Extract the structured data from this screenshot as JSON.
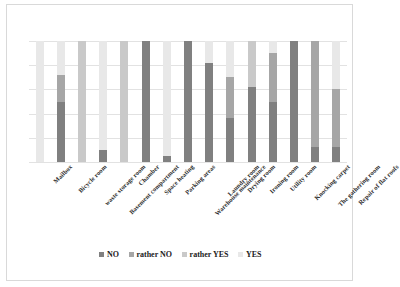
{
  "chart_data": {
    "type": "bar",
    "subtype": "stacked-100-percent",
    "title": "",
    "xlabel": "",
    "ylabel": "",
    "ylim": [
      0,
      100
    ],
    "grid": true,
    "legend_position": "bottom",
    "categories": [
      "Mailbox",
      "Bicycle room",
      "waste storage room",
      "Basement compartment",
      "Chamber",
      "Space heating",
      "Parking areas",
      "Warehouse maintenance",
      "Laundry room",
      "Drying room",
      "Ironing room",
      "Utility room",
      "Knocking carpet",
      "The gathering room",
      "Repair of flat roofs"
    ],
    "series": [
      {
        "name": "NO",
        "color": "#808080",
        "values": [
          0,
          50,
          0,
          10,
          0,
          100,
          5,
          100,
          82,
          36,
          62,
          50,
          100,
          12,
          12
        ]
      },
      {
        "name": "rather NO",
        "color": "#a6a6a6",
        "values": [
          0,
          22,
          0,
          0,
          0,
          0,
          0,
          0,
          0,
          34,
          0,
          40,
          0,
          88,
          48
        ]
      },
      {
        "name": "rather YES",
        "color": "#c9c9c9",
        "values": [
          0,
          0,
          100,
          0,
          100,
          0,
          0,
          0,
          0,
          0,
          38,
          0,
          0,
          0,
          0
        ]
      },
      {
        "name": "YES",
        "color": "#e8e8e8",
        "values": [
          100,
          28,
          0,
          90,
          0,
          0,
          95,
          0,
          18,
          30,
          0,
          10,
          0,
          0,
          40
        ]
      }
    ],
    "gridline_count": 5
  },
  "legend": {
    "items": [
      {
        "label": "NO",
        "color": "#808080"
      },
      {
        "label": "rather NO",
        "color": "#a6a6a6"
      },
      {
        "label": "rather YES",
        "color": "#c9c9c9"
      },
      {
        "label": "YES",
        "color": "#e8e8e8"
      }
    ]
  }
}
